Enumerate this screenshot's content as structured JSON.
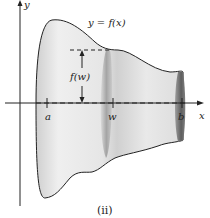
{
  "figure": {
    "function_label": "y = f(x)",
    "height_label": "f(w)",
    "y_axis_label": "y",
    "x_axis_label": "x",
    "tick_labels": [
      "a",
      "w",
      "b"
    ],
    "caption": "(ii)"
  }
}
